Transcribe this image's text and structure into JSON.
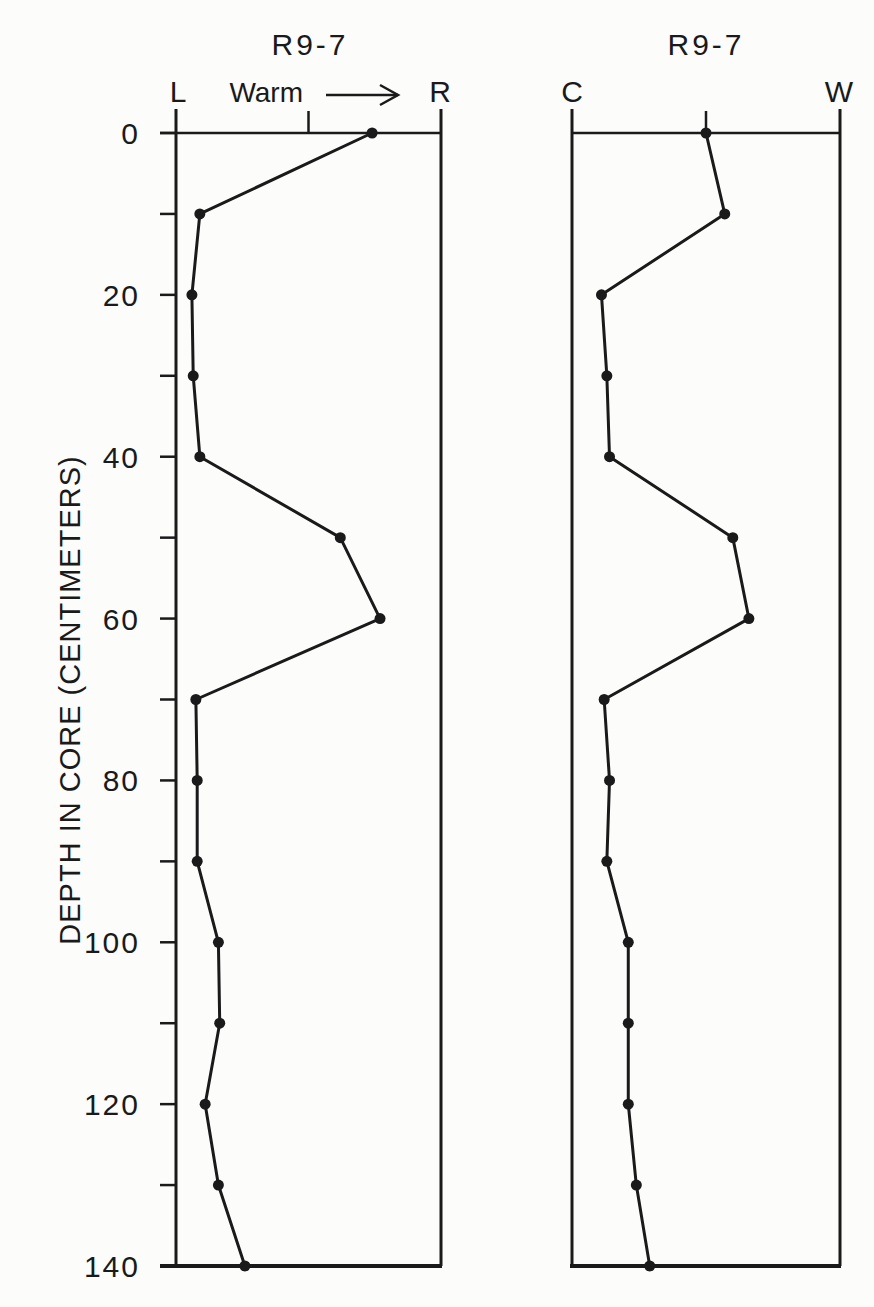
{
  "figure": {
    "y_axis_label": "DEPTH IN CORE (CENTIMETERS)",
    "y_ticks_major": [
      "0",
      "20",
      "40",
      "60",
      "80",
      "100",
      "120",
      "140"
    ],
    "ink_color": "#1a1a1a",
    "background": "#fcfcfb"
  },
  "chart_data": [
    {
      "type": "line",
      "title": "R9-7",
      "x_left_label": "L",
      "x_right_label": "R",
      "x_annotation": "Warm",
      "x_annotation_arrow": "→",
      "xlabel": "L to R (relative scale; right = warm)",
      "ylabel": "DEPTH IN CORE (CENTIMETERS)",
      "xlim": [
        0,
        1
      ],
      "ylim": [
        0,
        140
      ],
      "y_inverted": true,
      "y_major_ticks": [
        0,
        20,
        40,
        60,
        80,
        100,
        120,
        140
      ],
      "y_minor_ticks": [
        10,
        30,
        50,
        70,
        90,
        110,
        130
      ],
      "x_mid_tick": 0.5,
      "grid": false,
      "markers": "filled-circle",
      "depth": [
        0,
        10,
        20,
        30,
        40,
        50,
        60,
        70,
        80,
        90,
        100,
        110,
        120,
        130,
        140
      ],
      "values": [
        0.74,
        0.09,
        0.06,
        0.065,
        0.09,
        0.62,
        0.77,
        0.075,
        0.08,
        0.08,
        0.16,
        0.165,
        0.11,
        0.16,
        0.26
      ]
    },
    {
      "type": "line",
      "title": "R9-7",
      "x_left_label": "C",
      "x_right_label": "W",
      "xlabel": "C (cold) to W (warm), relative scale",
      "ylabel": "DEPTH IN CORE (CENTIMETERS)",
      "xlim": [
        0,
        1
      ],
      "ylim": [
        0,
        140
      ],
      "y_inverted": true,
      "x_mid_tick": 0.5,
      "grid": false,
      "markers": "filled-circle",
      "depth": [
        0,
        10,
        20,
        30,
        40,
        50,
        60,
        70,
        80,
        90,
        100,
        110,
        120,
        130,
        140
      ],
      "values": [
        0.5,
        0.57,
        0.11,
        0.13,
        0.14,
        0.6,
        0.66,
        0.12,
        0.14,
        0.13,
        0.21,
        0.21,
        0.21,
        0.24,
        0.29
      ]
    }
  ]
}
